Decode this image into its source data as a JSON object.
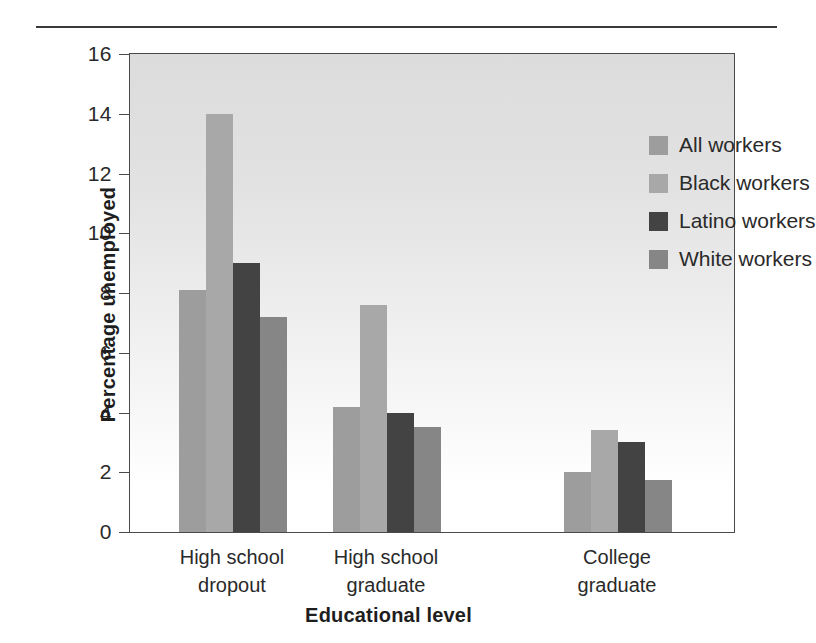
{
  "chart_data": {
    "type": "bar",
    "title": "",
    "xlabel": "Educational level",
    "ylabel": "Percentage unemployed",
    "categories": [
      "High school\ndropout",
      "High school\ngraduate",
      "College\ngraduate"
    ],
    "series": [
      {
        "name": "All workers",
        "color": "#9d9d9d",
        "values": [
          8.1,
          4.2,
          2.0
        ]
      },
      {
        "name": "Black workers",
        "color": "#a8a8a8",
        "values": [
          14.0,
          7.6,
          3.4
        ]
      },
      {
        "name": "Latino workers",
        "color": "#434343",
        "values": [
          9.0,
          4.0,
          3.0
        ]
      },
      {
        "name": "White workers",
        "color": "#868686",
        "values": [
          7.2,
          3.5,
          1.75
        ]
      }
    ],
    "ylim": [
      0,
      16
    ],
    "yticks": [
      16,
      14,
      12,
      10,
      8,
      6,
      4,
      2,
      0
    ],
    "ytick_labels": [
      "16",
      "14",
      "12",
      "10",
      "8",
      "6",
      "4",
      "2",
      "0"
    ],
    "grid": false,
    "legend_position": "top-right",
    "legend_entries": [
      "All workers",
      "Black workers",
      "Latino workers",
      "White workers"
    ]
  },
  "axis": {
    "x_title": "Educational level",
    "y_title": "Percentage unemployed"
  }
}
